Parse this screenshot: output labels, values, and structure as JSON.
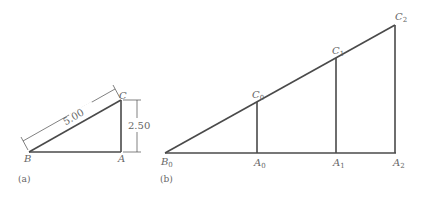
{
  "figure_a": {
    "caption": "(a)",
    "vertices": {
      "B": "B",
      "A": "A",
      "C": "C"
    },
    "hypotenuse_length": "5.00",
    "height_length": "2.50"
  },
  "figure_b": {
    "caption": "(b)",
    "base_vertex": {
      "letter": "B",
      "sub": "0"
    },
    "bottom_vertices": [
      {
        "letter": "A",
        "sub": "0"
      },
      {
        "letter": "A",
        "sub": "1"
      },
      {
        "letter": "A",
        "sub": "2"
      }
    ],
    "top_vertices": [
      {
        "letter": "C",
        "sub": "0"
      },
      {
        "letter": "C",
        "sub": "1"
      },
      {
        "letter": "C",
        "sub": "2"
      }
    ]
  },
  "colors": {
    "line": "#4a4a4a",
    "text": "#666666"
  }
}
